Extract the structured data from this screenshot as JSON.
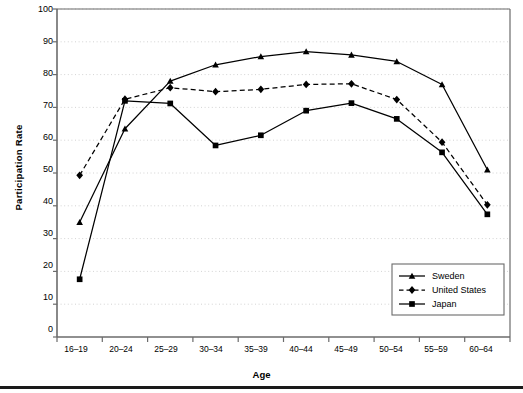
{
  "chart_data": {
    "type": "line",
    "title": "",
    "xlabel": "Age",
    "ylabel": "Participation Rate",
    "categories": [
      "16–19",
      "20–24",
      "25–29",
      "30–34",
      "35–39",
      "40–44",
      "45–49",
      "50–54",
      "55–59",
      "60–64"
    ],
    "ylim": [
      0,
      100
    ],
    "yticks": [
      0,
      10,
      20,
      30,
      40,
      50,
      60,
      70,
      80,
      90,
      100
    ],
    "grid": "horizontal-dotted",
    "legend_position": "bottom-right-inside",
    "series": [
      {
        "name": "Sweden",
        "marker": "triangle",
        "linestyle": "solid",
        "color": "#000000",
        "values": [
          35,
          63.5,
          78,
          83,
          85.5,
          87,
          86,
          84,
          77,
          51
        ]
      },
      {
        "name": "United States",
        "marker": "diamond",
        "linestyle": "dashed",
        "color": "#000000",
        "values": [
          49.3,
          72.5,
          76,
          74.8,
          75.5,
          77,
          77.2,
          72.4,
          59.4,
          40.3
        ]
      },
      {
        "name": "Japan",
        "marker": "square",
        "linestyle": "solid",
        "color": "#000000",
        "values": [
          17.6,
          72,
          71.2,
          58.4,
          61.5,
          69,
          71.3,
          66.5,
          56.3,
          37.4
        ]
      }
    ]
  },
  "axes": {
    "ylabel": "Participation Rate",
    "xlabel": "Age",
    "ytick_labels": [
      "100",
      "90",
      "80",
      "70",
      "60",
      "50",
      "40",
      "30",
      "20",
      "10",
      "0"
    ],
    "xtick_labels": [
      "16–19",
      "20–24",
      "25–29",
      "30–34",
      "35–39",
      "40–44",
      "45–49",
      "50–54",
      "55–59",
      "60–64"
    ]
  },
  "legend": {
    "items": [
      {
        "label": "Sweden",
        "marker": "triangle",
        "linestyle": "solid"
      },
      {
        "label": "United States",
        "marker": "diamond",
        "linestyle": "dashed"
      },
      {
        "label": "Japan",
        "marker": "square",
        "linestyle": "solid"
      }
    ]
  },
  "colors": {
    "foreground": "#000000",
    "grid": "#c8c8c8",
    "axis": "#6b6b6b",
    "background": "#ffffff"
  }
}
